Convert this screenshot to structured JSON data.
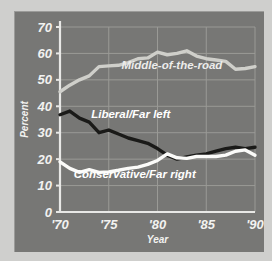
{
  "chart_data": {
    "type": "line",
    "title": "",
    "xlabel": "Year",
    "ylabel": "Percent",
    "xlim": [
      1970,
      1990
    ],
    "ylim": [
      0,
      70
    ],
    "grid": true,
    "legend_position": "inline-labels",
    "xticks": [
      1970,
      1975,
      1980,
      1985,
      1990
    ],
    "xticklabels": [
      "'70",
      "'75",
      "'80",
      "'85",
      "'90"
    ],
    "yticks": [
      0,
      10,
      20,
      30,
      40,
      50,
      60,
      70
    ],
    "yticklabels": [
      "0",
      "10",
      "20",
      "30",
      "40",
      "50",
      "60",
      "70"
    ],
    "x": [
      1970,
      1971,
      1972,
      1973,
      1974,
      1975,
      1976,
      1977,
      1978,
      1979,
      1980,
      1981,
      1982,
      1983,
      1984,
      1985,
      1986,
      1987,
      1988,
      1989,
      1990
    ],
    "series": [
      {
        "name": "Middle-of-the-road",
        "color": "#cfcfca",
        "label_color": "#ececeb",
        "values": [
          45.5,
          48.0,
          50.0,
          51.5,
          55.0,
          55.3,
          55.5,
          56.5,
          58.0,
          58.3,
          60.5,
          59.5,
          60.0,
          61.0,
          59.0,
          58.0,
          57.5,
          57.0,
          54.0,
          54.3,
          55.0
        ]
      },
      {
        "name": "Liberal/Far left",
        "color": "#1a1a18",
        "label_color": "#ffffff",
        "values": [
          36.8,
          38.2,
          35.5,
          34.0,
          30.0,
          31.0,
          29.5,
          28.0,
          27.0,
          26.0,
          24.0,
          21.5,
          20.0,
          20.8,
          21.5,
          22.0,
          23.0,
          24.0,
          24.5,
          24.0,
          24.5
        ]
      },
      {
        "name": "Conservative/Far right",
        "color": "#fbfbf9",
        "label_color": "#ffffff",
        "values": [
          19.0,
          16.5,
          15.0,
          16.0,
          15.0,
          15.2,
          15.8,
          16.5,
          17.0,
          18.0,
          19.5,
          22.0,
          20.5,
          20.3,
          21.0,
          21.0,
          21.0,
          21.5,
          23.0,
          23.5,
          21.5
        ]
      }
    ],
    "annotations": [
      {
        "text": "Middle-of-the-road",
        "x": 1976.3,
        "y": 54.0,
        "anchor": "start",
        "color": "#ececeb"
      },
      {
        "text": "Liberal/Far left",
        "x": 1973.2,
        "y": 35.5,
        "anchor": "start",
        "color": "#ffffff"
      },
      {
        "text": "Conservative/Far right",
        "x": 1971.4,
        "y": 12.8,
        "anchor": "start",
        "color": "#ffffff"
      }
    ],
    "style": {
      "panel_bg": "#777775",
      "page_bg": "#cfcfcd",
      "grid_color": "#9a9a96",
      "axis_color": "#e8e8e6",
      "tick_text_color": "#f2f2f0"
    }
  }
}
